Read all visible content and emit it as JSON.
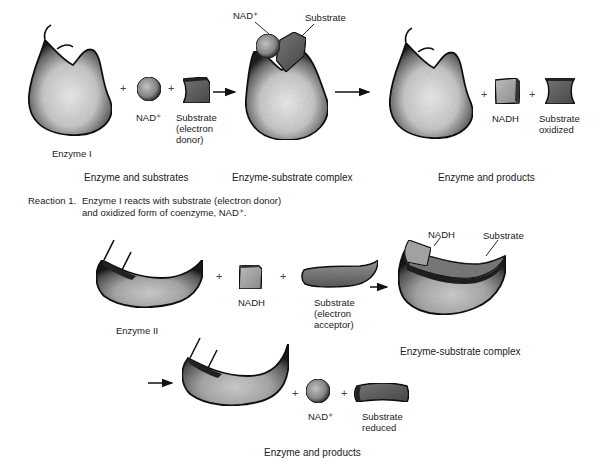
{
  "diagram": {
    "type": "enzyme-coenzyme redox reaction illustration",
    "reaction1": {
      "number_label": "Reaction 1.",
      "description": "Enzyme I reacts with substrate (electron donor)\nand oxidized form of coenzyme, NAD⁺.",
      "stages": [
        {
          "caption": "Enzyme and substrates",
          "items": [
            {
              "name": "enzyme-1",
              "label": "Enzyme I"
            },
            {
              "name": "nad-plus",
              "label": "NAD⁺"
            },
            {
              "name": "substrate-donor",
              "label": "Substrate\n(electron\ndonor)"
            }
          ]
        },
        {
          "caption": "Enzyme-substrate complex",
          "items": [
            {
              "name": "complex-nad",
              "label": "NAD⁺"
            },
            {
              "name": "complex-substrate",
              "label": "Substrate"
            }
          ]
        },
        {
          "caption": "Enzyme and products",
          "items": [
            {
              "name": "nadh",
              "label": "NADH"
            },
            {
              "name": "substrate-oxidized",
              "label": "Substrate\noxidized"
            }
          ]
        }
      ]
    },
    "reaction2": {
      "stages": [
        {
          "items": [
            {
              "name": "enzyme-2",
              "label": "Enzyme II"
            },
            {
              "name": "nadh",
              "label": "NADH"
            },
            {
              "name": "substrate-acceptor",
              "label": "Substrate\n(electron\nacceptor)"
            }
          ]
        },
        {
          "caption": "Enzyme-substrate complex",
          "items": [
            {
              "name": "complex-nadh",
              "label": "NADH"
            },
            {
              "name": "complex-substrate",
              "label": "Substrate"
            }
          ]
        },
        {
          "caption": "Enzyme and products",
          "items": [
            {
              "name": "nad-plus",
              "label": "NAD⁺"
            },
            {
              "name": "substrate-reduced",
              "label": "Substrate\nreduced"
            }
          ]
        }
      ]
    },
    "symbols": {
      "plus": "+"
    },
    "colors": {
      "outline": "#111111",
      "enzyme_light": "#e6e6e6",
      "enzyme_dark": "#3a3a3a",
      "substrate_dark": "#555555",
      "nadh_fill": "#a8a8a8"
    }
  }
}
